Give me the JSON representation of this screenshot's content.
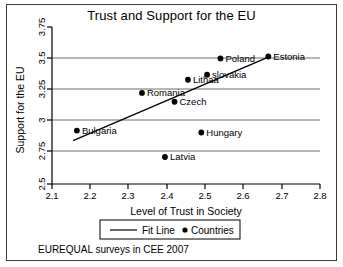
{
  "chart_data": {
    "type": "scatter",
    "title": "Trust and Support for the EU",
    "xlabel": "Level of Trust in Society",
    "ylabel": "Support for the EU",
    "xlim": [
      2.1,
      2.8
    ],
    "ylim": [
      2.5,
      3.75
    ],
    "xticks": [
      "2.1",
      "2.2",
      "2.3",
      "2.4",
      "2.5",
      "2.6",
      "2.7",
      "2.8"
    ],
    "yticks": [
      "2.5",
      "2.75",
      "3",
      "3.25",
      "3.5",
      "3.75"
    ],
    "grid": "horizontal",
    "points": [
      {
        "label": "Bulgaria",
        "x": 2.165,
        "y": 2.925,
        "label_side": "right"
      },
      {
        "label": "Romania",
        "x": 2.335,
        "y": 3.225,
        "label_side": "right"
      },
      {
        "label": "Czech",
        "x": 2.42,
        "y": 3.155,
        "label_side": "right"
      },
      {
        "label": "Latvia",
        "x": 2.395,
        "y": 2.715,
        "label_side": "right"
      },
      {
        "label": "Hungary",
        "x": 2.49,
        "y": 2.91,
        "label_side": "right"
      },
      {
        "label": "Lithaa",
        "x": 2.455,
        "y": 3.33,
        "label_side": "right"
      },
      {
        "label": "slovakia",
        "x": 2.505,
        "y": 3.37,
        "label_side": "right"
      },
      {
        "label": "Poland",
        "x": 2.54,
        "y": 3.5,
        "label_side": "right"
      },
      {
        "label": "Estonia",
        "x": 2.665,
        "y": 3.515,
        "label_side": "right"
      }
    ],
    "fit_line": {
      "x1": 2.155,
      "y1": 2.845,
      "x2": 2.665,
      "y2": 3.51
    },
    "legend": {
      "position": "below-axis",
      "entries": [
        {
          "label": "Fit Line",
          "marker": "line"
        },
        {
          "label": "Countries",
          "marker": "dot"
        }
      ]
    },
    "caption": "EUREQUAL surveys in CEE 2007",
    "colors": {
      "point": "#000000",
      "fit_line": "#000000",
      "gridline": "#6e6e6e",
      "axis": "#000000",
      "border": "#3a3a3a"
    }
  }
}
